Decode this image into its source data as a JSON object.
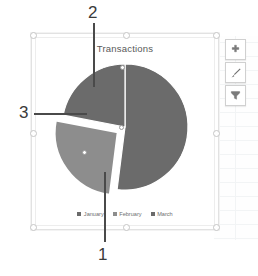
{
  "app": {
    "object_type": "excel-chart-object",
    "selected": true
  },
  "chart": {
    "title": "Transactions",
    "buttons": [
      {
        "name": "chart-elements-button",
        "icon": "plus-icon",
        "label": "Chart Elements"
      },
      {
        "name": "chart-styles-button",
        "icon": "brush-icon",
        "label": "Chart Styles"
      },
      {
        "name": "chart-filters-button",
        "icon": "funnel-icon",
        "label": "Chart Filters"
      }
    ]
  },
  "colors": {
    "slice_dark": "#6b6b6b",
    "slice_light": "#8d8d8d",
    "slice_gap": "#ffffff",
    "title_text": "#595959",
    "legend_text": "#6e6e6e",
    "callout_text": "#3a3a3a",
    "leader_line": "#4a4a4a",
    "frame_border": "#e2e2e2"
  },
  "callouts": [
    {
      "id": "callout-1",
      "label": "1",
      "points_to": "January"
    },
    {
      "id": "callout-2",
      "label": "2",
      "points_to": "February"
    },
    {
      "id": "callout-3",
      "label": "3",
      "points_to": "February"
    }
  ],
  "chart_data": {
    "type": "pie",
    "title": "Transactions",
    "categories": [
      "January",
      "February",
      "March"
    ],
    "values": [
      52,
      26,
      22
    ],
    "colors": [
      "#6b6b6b",
      "#8d8d8d",
      "#6b6b6b"
    ],
    "exploded": [
      "February"
    ],
    "legend": {
      "position": "bottom",
      "entries": [
        "January",
        "February",
        "March"
      ]
    },
    "grid": false,
    "data_labels": false
  }
}
